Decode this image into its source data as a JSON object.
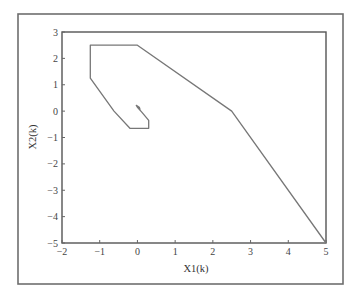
{
  "chart_data": {
    "type": "line",
    "title": "",
    "xlabel": "X1(k)",
    "ylabel": "X2(k)",
    "xlim": [
      -2,
      5
    ],
    "ylim": [
      -5,
      3
    ],
    "xticks": [
      -2,
      -1,
      0,
      1,
      2,
      3,
      4,
      5
    ],
    "yticks": [
      3,
      2,
      1,
      0,
      -1,
      -2,
      -3,
      -4,
      -5
    ],
    "xtick_labels": [
      "−2",
      "−1",
      "0",
      "1",
      "2",
      "3",
      "4",
      "5"
    ],
    "ytick_labels": [
      "3",
      "2",
      "1",
      "0",
      "−1",
      "−2",
      "−3",
      "−4",
      "−5"
    ],
    "grid": false,
    "legend": null,
    "series": [
      {
        "name": "state trajectory",
        "color": "#777777",
        "x": [
          5,
          2.5,
          0,
          -1.25,
          -1.25,
          -0.62,
          -0.2,
          0.3,
          0.3,
          0.12,
          0.0,
          -0.03,
          0.05,
          0.07
        ],
        "y": [
          -5,
          0,
          2.5,
          2.5,
          1.25,
          0,
          -0.65,
          -0.65,
          -0.35,
          -0.05,
          0.15,
          0.22,
          0.15,
          0.05
        ]
      }
    ]
  }
}
